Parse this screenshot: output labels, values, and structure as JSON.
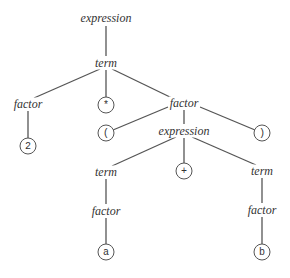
{
  "diagram": {
    "type": "parse-tree",
    "nodes": {
      "root": {
        "label": "expression",
        "x": 106,
        "y": 18,
        "kind": "nonterminal"
      },
      "term1": {
        "label": "term",
        "x": 106,
        "y": 63,
        "kind": "nonterminal"
      },
      "factor1": {
        "label": "factor",
        "x": 28,
        "y": 104,
        "kind": "nonterminal"
      },
      "times": {
        "label": "*",
        "x": 106,
        "y": 105,
        "kind": "terminal"
      },
      "factor2": {
        "label": "factor",
        "x": 184,
        "y": 103,
        "kind": "nonterminal"
      },
      "two": {
        "label": "2",
        "x": 28,
        "y": 146,
        "kind": "terminal"
      },
      "lparen": {
        "label": "(",
        "x": 106,
        "y": 133,
        "kind": "terminal"
      },
      "expr2": {
        "label": "expression",
        "x": 184,
        "y": 131,
        "kind": "nonterminal"
      },
      "rparen": {
        "label": ")",
        "x": 262,
        "y": 133,
        "kind": "terminal"
      },
      "term2": {
        "label": "term",
        "x": 106,
        "y": 172,
        "kind": "nonterminal"
      },
      "plus": {
        "label": "+",
        "x": 184,
        "y": 171,
        "kind": "terminal"
      },
      "term3": {
        "label": "term",
        "x": 262,
        "y": 171,
        "kind": "nonterminal"
      },
      "factor3": {
        "label": "factor",
        "x": 106,
        "y": 211,
        "kind": "nonterminal"
      },
      "factor4": {
        "label": "factor",
        "x": 262,
        "y": 210,
        "kind": "nonterminal"
      },
      "a": {
        "label": "a",
        "x": 106,
        "y": 252,
        "kind": "terminal"
      },
      "b": {
        "label": "b",
        "x": 262,
        "y": 252,
        "kind": "terminal"
      }
    },
    "edges": [
      [
        "root",
        "term1"
      ],
      [
        "term1",
        "factor1"
      ],
      [
        "term1",
        "times"
      ],
      [
        "term1",
        "factor2"
      ],
      [
        "factor1",
        "two"
      ],
      [
        "factor2",
        "lparen"
      ],
      [
        "factor2",
        "expr2"
      ],
      [
        "factor2",
        "rparen"
      ],
      [
        "expr2",
        "term2"
      ],
      [
        "expr2",
        "plus"
      ],
      [
        "expr2",
        "term3"
      ],
      [
        "term2",
        "factor3"
      ],
      [
        "term3",
        "factor4"
      ],
      [
        "factor3",
        "a"
      ],
      [
        "factor4",
        "b"
      ]
    ],
    "line_color": "#555555"
  }
}
